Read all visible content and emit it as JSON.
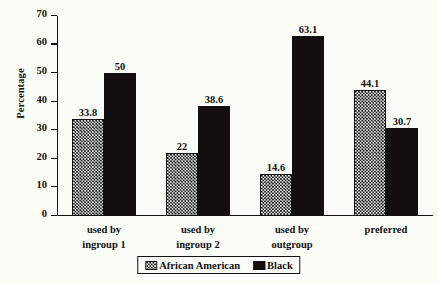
{
  "chart_data": {
    "type": "bar",
    "title": "",
    "subtitle": "",
    "xlabel": "",
    "ylabel": "Percentage",
    "ylim": [
      0,
      70
    ],
    "yticks": [
      0,
      10,
      20,
      30,
      40,
      50,
      60,
      70
    ],
    "ytick_labels": [
      "0",
      "10",
      "20",
      "30",
      "40",
      "50",
      "60",
      "70"
    ],
    "grid": false,
    "legend_position": "bottom-center",
    "categories": [
      "used by ingroup 1",
      "used by ingroup 2",
      "used by outgroup",
      "preferred"
    ],
    "category_lines": [
      [
        "used by",
        "ingroup 1"
      ],
      [
        "used by",
        "ingroup 2"
      ],
      [
        "used by",
        "outgroup"
      ],
      [
        "preferred",
        ""
      ]
    ],
    "series": [
      {
        "name": "African American",
        "pattern": "dotted",
        "color": "#fbfbf5",
        "values": [
          33.8,
          22,
          14.6,
          44.1
        ],
        "labels": [
          "33.8",
          "22",
          "14.6",
          "44.1"
        ]
      },
      {
        "name": "Black",
        "pattern": "solid",
        "color": "#140f0c",
        "values": [
          50,
          38.6,
          63.1,
          30.7
        ],
        "labels": [
          "50",
          "38.6",
          "63.1",
          "30.7"
        ]
      }
    ]
  },
  "legend": {
    "items": [
      {
        "label": "African American",
        "pattern": "dotted"
      },
      {
        "label": "Black",
        "pattern": "solid"
      }
    ]
  },
  "axis": {
    "y_title": "Percentage"
  },
  "colors": {
    "background": "#fdfdf7",
    "ink": "#111111",
    "solid_bar": "#140f0c",
    "dotted_bar_fill": "#fbfbf5"
  }
}
